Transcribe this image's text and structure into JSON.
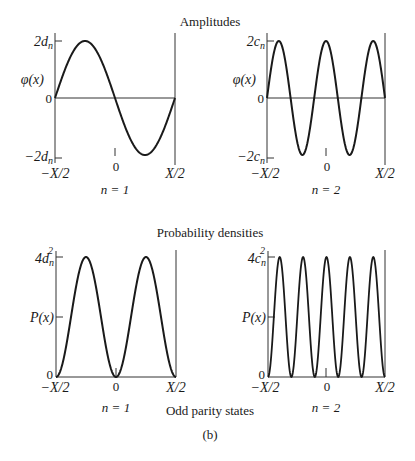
{
  "titles": {
    "amplitudes": "Amplitudes",
    "probability": "Probability densities",
    "caption": "Odd parity states",
    "sublabel": "(b)"
  },
  "plots": {
    "amp_n1": {
      "ytop": "2d",
      "ytop_sub": "n",
      "ybottom": "−2d",
      "ybottom_sub": "n",
      "ylabel": "φ(x)",
      "zero": "0",
      "xleft": "−X/2",
      "xmid": "0",
      "xright": "X/2",
      "n_label": "n = 1"
    },
    "amp_n2": {
      "ytop": "2c",
      "ytop_sub": "n",
      "ybottom": "−2c",
      "ybottom_sub": "n",
      "ylabel": "φ(x)",
      "zero": "0",
      "xleft": "−X/2",
      "xmid": "0",
      "xright": "X/2",
      "n_label": "n = 2"
    },
    "prob_n1": {
      "ytop": "4d",
      "ytop_sub": "n",
      "ytop_sup": "2",
      "ylabel": "P(x)",
      "zero": "0",
      "xleft": "−X/2",
      "xmid": "0",
      "xright": "X/2",
      "n_label": "n = 1"
    },
    "prob_n2": {
      "ytop": "4c",
      "ytop_sub": "n",
      "ytop_sup": "2",
      "ylabel": "P(x)",
      "zero": "0",
      "xleft": "−X/2",
      "xmid": "0",
      "xright": "X/2",
      "n_label": "n = 2"
    }
  },
  "chart_data": [
    {
      "type": "line",
      "title": "Amplitudes, n = 1",
      "xlabel": "x",
      "ylabel": "φ(x)",
      "xlim": [
        "-X/2",
        "X/2"
      ],
      "ylim": [
        "-2d_n",
        "2d_n"
      ],
      "function": "2d_n·sin(2πx/X)"
    },
    {
      "type": "line",
      "title": "Amplitudes, n = 2",
      "xlabel": "x",
      "ylabel": "φ(x)",
      "xlim": [
        "-X/2",
        "X/2"
      ],
      "ylim": [
        "-2c_n",
        "2c_n"
      ],
      "function": "2c_n·sin(5π(x+X/2)/X)",
      "peaks": 3,
      "troughs": 2
    },
    {
      "type": "line",
      "title": "Probability densities, n = 1",
      "xlabel": "x",
      "ylabel": "P(x)",
      "xlim": [
        "-X/2",
        "X/2"
      ],
      "ylim": [
        0,
        "4d_n^2"
      ],
      "function": "4d_n²·sin²(2πx/X)",
      "peaks": 2
    },
    {
      "type": "line",
      "title": "Probability densities, n = 2",
      "xlabel": "x",
      "ylabel": "P(x)",
      "xlim": [
        "-X/2",
        "X/2"
      ],
      "ylim": [
        0,
        "4c_n^2"
      ],
      "function": "4c_n²·sin²(5π(x+X/2)/X)",
      "peaks": 5
    }
  ]
}
